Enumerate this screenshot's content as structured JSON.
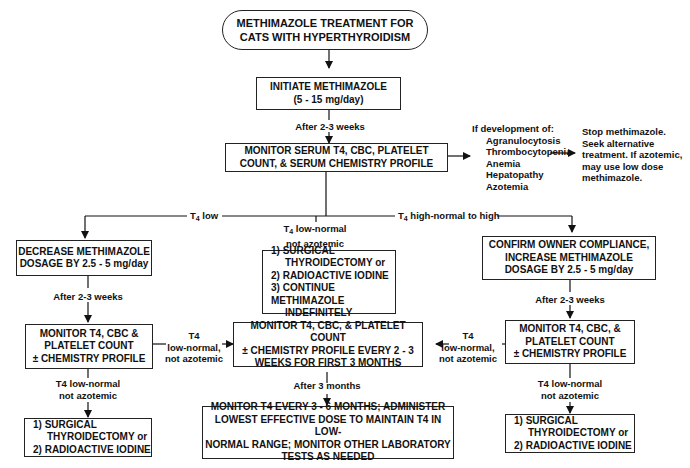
{
  "title": {
    "line1": "METHIMAZOLE TREATMENT FOR",
    "line2": "CATS WITH HYPERTHYROIDISM"
  },
  "initiate": {
    "line1": "INITIATE METHIMAZOLE",
    "line2": "(5 - 15 mg/day)"
  },
  "after_initiate": "After 2-3 weeks",
  "monitor_serum": {
    "line1": "MONITOR SERUM T4, CBC, PLATELET",
    "line2": "COUNT, & SERUM CHEMISTRY PROFILE"
  },
  "adverse": {
    "heading": "If development of:",
    "items": [
      "Agranulocytosis",
      "Thrombocytopenia",
      "Anemia",
      "Hepatopathy",
      "Azotemia"
    ]
  },
  "stop": {
    "lines": [
      "Stop methimazole.",
      "Seek alternative",
      "treatment.  If azotemic,",
      "may use low dose",
      "methimazole."
    ]
  },
  "branch_low": {
    "prefix": "T",
    "sub": "4",
    "text": " low"
  },
  "branch_high": {
    "prefix": "T",
    "sub": "4",
    "text": " high-normal to high"
  },
  "branch_mid": {
    "prefix": "T",
    "sub": "4",
    "line1": " low-normal",
    "line2": "not azotemic"
  },
  "decrease": {
    "line1": "DECREASE METHIMAZOLE",
    "line2": "DOSAGE BY 2.5 - 5 mg/day"
  },
  "mid_options": {
    "lines": [
      "1) SURGICAL",
      "THYROIDECTOMY or",
      "2) RADIOACTIVE IODINE",
      "3) CONTINUE METHIMAZOLE",
      "INDEFINITELY"
    ]
  },
  "confirm": {
    "line1": "CONFIRM OWNER COMPLIANCE,",
    "line2": "INCREASE METHIMAZOLE",
    "line3": "DOSAGE BY 2.5 - 5 mg/day"
  },
  "after_left": "After 2-3 weeks",
  "after_right": "After 2-3 weeks",
  "monitor_left": {
    "line1": "MONITOR T4, CBC &",
    "line2": "PLATELET COUNT",
    "line3": "± CHEMISTRY PROFILE"
  },
  "monitor_center": {
    "line1": "MONITOR T4, CBC, & PLATELET COUNT",
    "line2": "± CHEMISTRY PROFILE EVERY 2 - 3",
    "line3": "WEEKS FOR FIRST 3 MONTHS"
  },
  "monitor_right": {
    "line1": "MONITOR T4, CBC, &",
    "line2": "PLATELET COUNT",
    "line3": "± CHEMISTRY PROFILE"
  },
  "link_left": {
    "l1": "T4",
    "l2": "low-normal,",
    "l3": "not azotemic"
  },
  "link_right": {
    "l1": "T4",
    "l2": "low-normal,",
    "l3": "not azotemic"
  },
  "after_3_months": "After 3 months",
  "left_cond": {
    "line1": "T4 low-normal",
    "line2": "not azotemic"
  },
  "right_cond": {
    "line1": "T4 low-normal",
    "line2": "not azotemic"
  },
  "left_final": {
    "lines": [
      "1) SURGICAL",
      "THYROIDECTOMY or",
      "2) RADIOACTIVE IODINE"
    ]
  },
  "right_final": {
    "lines": [
      "1) SURGICAL",
      "THYROIDECTOMY or",
      "2) RADIOACTIVE IODINE"
    ]
  },
  "long_term": {
    "line1": "MONITOR T4 EVERY 3 - 6 MONTHS; ADMINISTER",
    "line2": "LOWEST EFFECTIVE DOSE TO MAINTAIN T4 IN LOW-",
    "line3": "NORMAL RANGE; MONITOR OTHER LABORATORY",
    "line4": "TESTS AS NEEDED"
  }
}
